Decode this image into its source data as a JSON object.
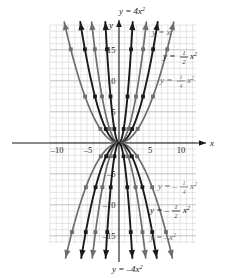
{
  "figure": {
    "type": "math-graph"
  },
  "axes": {
    "x_axis_name": "x",
    "y_axis_name": "y",
    "x_ticks": [
      {
        "label": "–10",
        "value": -10
      },
      {
        "label": "–5",
        "value": -5
      },
      {
        "label": "5",
        "value": 5
      },
      {
        "label": "10",
        "value": 10
      }
    ],
    "y_ticks": [
      {
        "label": "15",
        "value": 15
      },
      {
        "label": "10",
        "value": 10
      },
      {
        "label": "5",
        "value": 5
      },
      {
        "label": "–5",
        "value": -5
      },
      {
        "label": "–10",
        "value": -10
      },
      {
        "label": "–15",
        "value": -15
      }
    ],
    "xlim": [
      -11,
      12
    ],
    "ylim": [
      -18,
      18
    ],
    "grid": true
  },
  "labels": {
    "top": {
      "text": "y = 4x",
      "exp": "2",
      "full": "y = 4x²"
    },
    "bottom": {
      "text": "y = –4x",
      "exp": "2",
      "full": "y = –4x²"
    },
    "right_1": {
      "pre": "y = x",
      "exp": "2",
      "full": "y = x²"
    },
    "right_2": {
      "pre": "y = ",
      "num": "1",
      "den": "2",
      "post": "x",
      "exp": "2",
      "full": "y = 1/2 x²"
    },
    "right_3": {
      "pre": "y = ",
      "num": "1",
      "den": "4",
      "post": "x",
      "exp": "2",
      "full": "y = 1/4 x²"
    },
    "right_4": {
      "pre": "y = –",
      "num": "1",
      "den": "4",
      "post": "x",
      "exp": "2",
      "full": "y = –1/4 x²"
    },
    "right_5": {
      "pre": "y = –",
      "num": "1",
      "den": "2",
      "post": "x",
      "exp": "2",
      "full": "y = –1/2 x²"
    },
    "right_6": {
      "pre": "y = –x",
      "exp": "2",
      "full": "y = –x²"
    }
  },
  "chart_data": {
    "type": "line",
    "title": "",
    "xlabel": "x",
    "ylabel": "y",
    "xlim": [
      -11,
      12
    ],
    "ylim": [
      -18,
      18
    ],
    "grid": true,
    "legend_position": "inline-curve-labels",
    "series": [
      {
        "name": "y = 4x²",
        "a": 4,
        "color": "#1a1a1a",
        "opens": "up",
        "label_position": "top"
      },
      {
        "name": "y = x²",
        "a": 1,
        "color": "#6d6d6d",
        "opens": "up",
        "label_position": "right"
      },
      {
        "name": "y = 1/2 x²",
        "a": 0.5,
        "color": "#1a1a1a",
        "opens": "up",
        "label_position": "right"
      },
      {
        "name": "y = 1/4 x²",
        "a": 0.25,
        "color": "#6d6d6d",
        "opens": "up",
        "label_position": "right"
      },
      {
        "name": "y = –1/4 x²",
        "a": -0.25,
        "color": "#6d6d6d",
        "opens": "down",
        "label_position": "right"
      },
      {
        "name": "y = –1/2 x²",
        "a": -0.5,
        "color": "#1a1a1a",
        "opens": "down",
        "label_position": "right"
      },
      {
        "name": "y = –x²",
        "a": -1,
        "color": "#6d6d6d",
        "opens": "down",
        "label_position": "right"
      },
      {
        "name": "y = –4x²",
        "a": -4,
        "color": "#1a1a1a",
        "opens": "down",
        "label_position": "bottom"
      }
    ],
    "marked_points_note": "Each curve carries square point markers and arrowheads at both ends"
  },
  "colors": {
    "curve_dark": "#1a1a1a",
    "curve_gray": "#6d6d6d",
    "grid_line": "#c8c8c8",
    "grid_line_major": "#a8a8a8",
    "axis": "#1a1a1a",
    "background": "#ffffff"
  }
}
